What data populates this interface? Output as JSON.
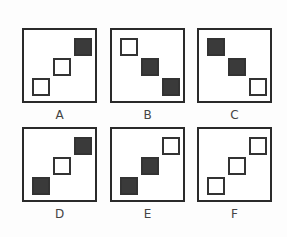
{
  "panels": [
    {
      "label": "A",
      "squares": [
        {
          "pos": "top-right",
          "filled": true
        },
        {
          "pos": "middle",
          "filled": false
        },
        {
          "pos": "bottom-left",
          "filled": false
        }
      ],
      "diagonal": "rising"
    },
    {
      "label": "B",
      "squares": [
        {
          "pos": "top-left",
          "filled": false
        },
        {
          "pos": "middle",
          "filled": true
        },
        {
          "pos": "bottom-right",
          "filled": true
        }
      ],
      "diagonal": "falling"
    },
    {
      "label": "C",
      "squares": [
        {
          "pos": "top-left",
          "filled": true
        },
        {
          "pos": "middle",
          "filled": true
        },
        {
          "pos": "bottom-right",
          "filled": false
        }
      ],
      "diagonal": "falling"
    },
    {
      "label": "D",
      "squares": [
        {
          "pos": "top-right",
          "filled": true
        },
        {
          "pos": "middle",
          "filled": false
        },
        {
          "pos": "bottom-left",
          "filled": true
        }
      ],
      "diagonal": "rising"
    },
    {
      "label": "E",
      "squares": [
        {
          "pos": "top-right",
          "filled": false
        },
        {
          "pos": "middle",
          "filled": true
        },
        {
          "pos": "bottom-left",
          "filled": true
        }
      ],
      "diagonal": "rising"
    },
    {
      "label": "F",
      "squares": [
        {
          "pos": "top-right",
          "filled": false
        },
        {
          "pos": "middle",
          "filled": false
        },
        {
          "pos": "bottom-left",
          "filled": false
        }
      ],
      "diagonal": "rising"
    }
  ],
  "colors": {
    "filled": "#3a3a3a",
    "border": "#2a2a2a"
  }
}
